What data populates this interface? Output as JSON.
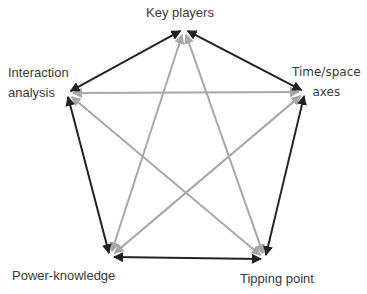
{
  "diagram": {
    "type": "pentagram-network",
    "nodes": [
      {
        "id": "key",
        "label": "Key players",
        "x": 184,
        "y": 29
      },
      {
        "id": "time",
        "label": "Time/space axes",
        "line1": "Time/space",
        "line2": "axes",
        "x": 305,
        "y": 92
      },
      {
        "id": "tipping",
        "label": "Tipping point",
        "x": 265,
        "y": 259
      },
      {
        "id": "power",
        "label": "Power-knowledge",
        "x": 110,
        "y": 257
      },
      {
        "id": "interaction",
        "label": "Interaction analysis",
        "line1": "Interaction",
        "line2": "analysis",
        "x": 67,
        "y": 93
      }
    ],
    "outer_edges": [
      {
        "from": "key",
        "to": "time",
        "color": "#222222",
        "bidirectional": true
      },
      {
        "from": "time",
        "to": "tipping",
        "color": "#222222",
        "bidirectional": true
      },
      {
        "from": "tipping",
        "to": "power",
        "color": "#222222",
        "bidirectional": true
      },
      {
        "from": "power",
        "to": "interaction",
        "color": "#222222",
        "bidirectional": true
      },
      {
        "from": "interaction",
        "to": "key",
        "color": "#222222",
        "bidirectional": true
      }
    ],
    "inner_edges": [
      {
        "from": "key",
        "to": "tipping",
        "color": "#a8a8a8",
        "bidirectional": true
      },
      {
        "from": "key",
        "to": "power",
        "color": "#a8a8a8",
        "bidirectional": true
      },
      {
        "from": "time",
        "to": "interaction",
        "color": "#a8a8a8",
        "bidirectional": true
      },
      {
        "from": "time",
        "to": "power",
        "color": "#a8a8a8",
        "bidirectional": true
      },
      {
        "from": "interaction",
        "to": "tipping",
        "color": "#a8a8a8",
        "bidirectional": true
      }
    ],
    "colors": {
      "outer": "#222222",
      "inner": "#a8a8a8",
      "text": "#3a3a3a",
      "background": "#ffffff"
    }
  }
}
